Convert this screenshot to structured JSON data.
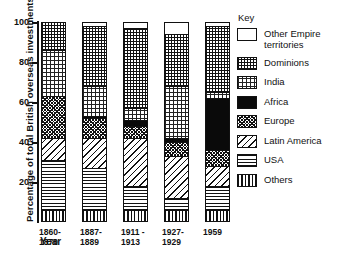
{
  "chart_data": {
    "type": "bar",
    "subtype": "stacked-bar-100-percent",
    "title": "",
    "xlabel": "Year",
    "ylabel": "Percentage of total British overseas investments",
    "ylim": [
      0,
      100
    ],
    "yticks": [
      20,
      40,
      60,
      80,
      100
    ],
    "grid": false,
    "legend_position": "right",
    "legend_title": "Key",
    "categories": [
      "1860-\n1870",
      "1887-\n1889",
      "1911 -\n1913",
      "1927-\n1929",
      "1959"
    ],
    "category_labels_flat": [
      "1860-1870",
      "1887-1889",
      "1911-1913",
      "1927-1929",
      "1959"
    ],
    "series": [
      {
        "name": "Others",
        "pattern": "vertical-lines",
        "values": [
          5,
          5,
          5,
          5,
          5
        ]
      },
      {
        "name": "USA",
        "pattern": "horizontal-lines",
        "values": [
          25,
          21,
          12,
          6,
          12
        ]
      },
      {
        "name": "Latin America",
        "pattern": "diagonal-hatch",
        "values": [
          11,
          15,
          24,
          21,
          10
        ]
      },
      {
        "name": "Europe",
        "pattern": "dense-crosshatch",
        "values": [
          21,
          10,
          6,
          7,
          8
        ]
      },
      {
        "name": "Africa",
        "pattern": "solid-black",
        "values": [
          0,
          1,
          3,
          2,
          26
        ]
      },
      {
        "name": "India",
        "pattern": "stipple-dots",
        "values": [
          23,
          15,
          6,
          26,
          3
        ]
      },
      {
        "name": "Dominions",
        "pattern": "grid-crosshatch",
        "values": [
          15,
          30,
          40,
          26,
          33
        ]
      },
      {
        "name": "Other Empire territories",
        "pattern": "white",
        "values": [
          0,
          3,
          4,
          7,
          3
        ]
      }
    ]
  },
  "legend": {
    "title": "Key",
    "items": [
      {
        "label": "Other Empire\nterritories",
        "pattern": "white"
      },
      {
        "label": "Dominions",
        "pattern": "grid-crosshatch"
      },
      {
        "label": "India",
        "pattern": "stipple-dots"
      },
      {
        "label": "Africa",
        "pattern": "solid-black"
      },
      {
        "label": "Europe",
        "pattern": "dense-crosshatch"
      },
      {
        "label": "Latin America",
        "pattern": "diagonal-hatch"
      },
      {
        "label": "USA",
        "pattern": "horizontal-lines"
      },
      {
        "label": "Others",
        "pattern": "vertical-lines"
      }
    ]
  },
  "axes": {
    "y_title": "Percentage of total British overseas investments",
    "x_title": "Year",
    "y_tick_labels": [
      "100",
      "80",
      "60",
      "40",
      "20"
    ]
  }
}
